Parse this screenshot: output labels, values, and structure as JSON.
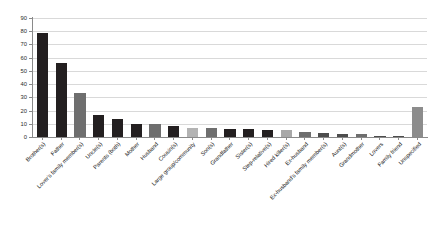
{
  "chart_data": {
    "type": "bar",
    "title": "",
    "subtitle": "",
    "xlabel": "",
    "ylabel": "",
    "ylim": [
      0,
      90
    ],
    "ytick_step": 10,
    "yticks": [
      0,
      10,
      20,
      30,
      40,
      50,
      60,
      70,
      80,
      90
    ],
    "grid": true,
    "legend": "none",
    "categories": [
      "Brother(s)",
      "Father",
      "Lover's family member(s)",
      "Uncle(s)",
      "Parents (both)",
      "Mother",
      "Husband",
      "Cousin(s)",
      "Large group/community",
      "Son(s)",
      "Grandfather",
      "Sister(s)",
      "Step-relative(s)",
      "Hired killer(s)",
      "Ex-husband",
      "Ex-husband's family member(s)",
      "Aunt(s)",
      "Grandmother",
      "Lovers",
      "Family friend",
      "Unspecified"
    ],
    "values": [
      79,
      56,
      33,
      17,
      14,
      10,
      10,
      8,
      7,
      7,
      6,
      6,
      5,
      5,
      4,
      3,
      2,
      2,
      1,
      1,
      23
    ],
    "bar_colors": [
      "#231f20",
      "#231f20",
      "#6e6e6e",
      "#231f20",
      "#231f20",
      "#231f20",
      "#6e6e6e",
      "#231f20",
      "#b3b3b3",
      "#6e6e6e",
      "#231f20",
      "#231f20",
      "#231f20",
      "#a8a8a8",
      "#6e6e6e",
      "#4d4d4d",
      "#4d4d4d",
      "#6e6e6e",
      "#4d4d4d",
      "#4d4d4d",
      "#8c8c8c"
    ]
  },
  "colors": {
    "background": "#ffffff",
    "gridline": "#d9d9d9",
    "axis": "#8a8a8a",
    "text": "#1a1a1a",
    "bar_dark": "#231f20",
    "bar_mid": "#6e6e6e",
    "bar_light": "#b3b3b3"
  }
}
